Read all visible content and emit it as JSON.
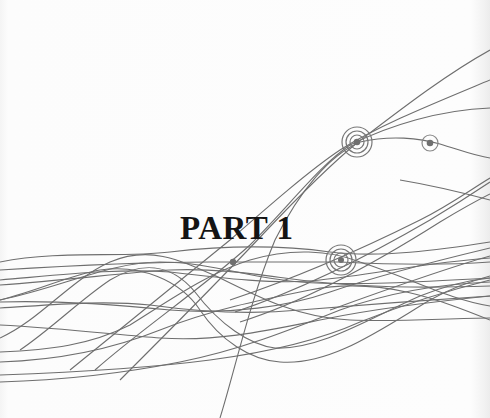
{
  "page": {
    "title": "PART 1",
    "decoration": {
      "type": "abstract wave lines",
      "line_color": "#6e6e6e",
      "marker_color": "#707070",
      "markers": [
        {
          "name": "target-marker-large",
          "rings": 3
        },
        {
          "name": "target-marker-small",
          "rings": 1
        },
        {
          "name": "target-marker-lower",
          "rings": 3
        },
        {
          "name": "dot-marker",
          "rings": 0
        }
      ]
    }
  }
}
